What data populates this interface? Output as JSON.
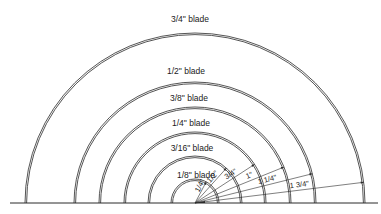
{
  "diagram": {
    "title": "",
    "center": {
      "x": 195,
      "y": 203
    },
    "colors": {
      "line": "#2a2a2a",
      "background": "#ffffff"
    },
    "blades": [
      {
        "label": "1/8\" blade",
        "fraction": "1/8",
        "radius_label": "1/4\"",
        "radius_px": 24,
        "label_y": 178,
        "label_x": 196,
        "radius_angle_deg": 62
      },
      {
        "label": "3/16\" blade",
        "fraction": "3/16",
        "radius_label": "1/2\"",
        "radius_px": 47,
        "label_y": 151,
        "label_x": 192,
        "radius_angle_deg": 48
      },
      {
        "label": "1/4\" blade",
        "fraction": "1/4",
        "radius_label": "3/4\"",
        "radius_px": 71,
        "label_y": 126,
        "label_x": 191,
        "radius_angle_deg": 33
      },
      {
        "label": "3/8\" blade",
        "fraction": "3/8",
        "radius_label": "1\"",
        "radius_px": 96,
        "label_y": 101,
        "label_x": 189,
        "radius_angle_deg": 22
      },
      {
        "label": "1/2\" blade",
        "fraction": "1/2",
        "radius_label": "1 1/4\"",
        "radius_px": 121,
        "label_y": 74,
        "label_x": 186,
        "radius_angle_deg": 14
      },
      {
        "label": "3/4\" blade",
        "fraction": "3/4",
        "radius_label": "1 3/4\"",
        "radius_px": 170,
        "label_y": 22,
        "label_x": 190,
        "radius_angle_deg": 7
      }
    ],
    "baseline": {
      "x1": 10,
      "x2": 378,
      "y": 203
    }
  }
}
